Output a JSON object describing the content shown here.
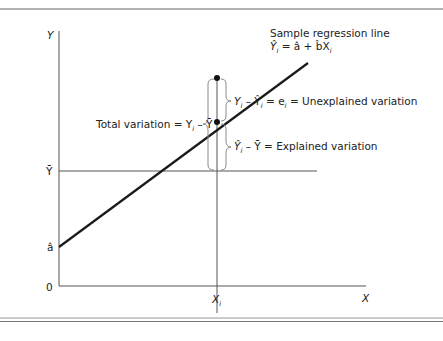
{
  "axes": {
    "y_label": "Y",
    "x_label": "X",
    "origin_label": "0",
    "y_bar_label": "Ȳ",
    "a_hat_label": "â",
    "x_i_label": "X",
    "x_i_sub": "i"
  },
  "regression": {
    "title": "Sample regression line",
    "equation_lhs": "Ŷ",
    "equation_sub": "i",
    "equation_rhs": " = â + b̂X",
    "equation_rhs_sub": "i"
  },
  "annotations": {
    "total": {
      "prefix": "Total variation = Y",
      "sub": "i",
      "suffix": " – Ȳ"
    },
    "unexplained": {
      "part1": "Y",
      "sub1": "i",
      "part2": " – Ŷ",
      "sub2": "i",
      "part3": " = e",
      "sub3": "i",
      "part4": " = Unexplained variation"
    },
    "explained": {
      "part1": "Ŷ",
      "sub1": "i",
      "part2": " – Ȳ = Explained variation"
    }
  },
  "colors": {
    "line": "#1a1a1a",
    "axis": "#555555",
    "brace": "#8a8a8a",
    "rule": "#9a9a9a"
  }
}
